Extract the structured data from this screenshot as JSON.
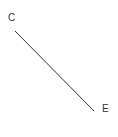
{
  "diagram": {
    "points": [
      {
        "label": "C",
        "label_x": 8,
        "label_y": 21
      },
      {
        "label": "E",
        "label_x": 102,
        "label_y": 112
      }
    ],
    "segment": {
      "from": "C",
      "to": "E",
      "x1": 15,
      "y1": 31,
      "x2": 94,
      "y2": 111,
      "color": "#333333"
    }
  }
}
